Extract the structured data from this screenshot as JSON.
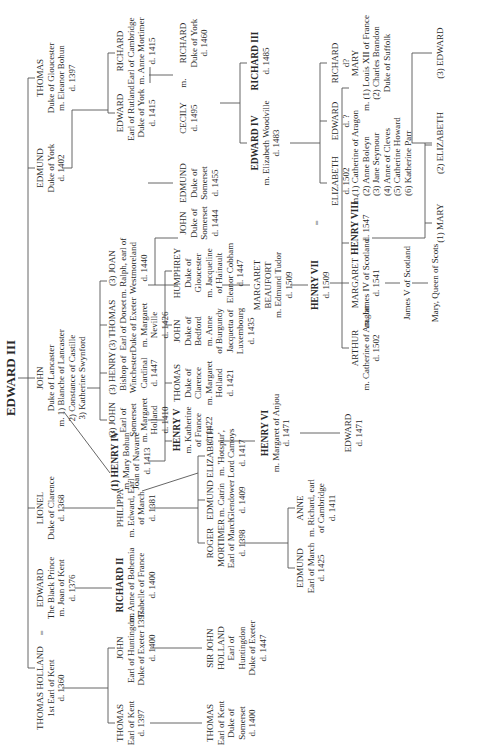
{
  "title": "EDWARD III",
  "nodes": {
    "thomas_holland": {
      "name": "THOMAS HOLLAND",
      "lines": [
        "1st Earl of Kent",
        "d. 1360"
      ]
    },
    "edward_bp": {
      "name": "EDWARD",
      "lines": [
        "The Black Prince",
        "m. Joan of Kent",
        "d. 1376"
      ]
    },
    "lionel": {
      "name": "LIONEL",
      "lines": [
        "Duke of Clarence",
        "d. 1368"
      ]
    },
    "john_gaunt": {
      "name": "JOHN",
      "lines": [
        "Duke of Lancaster",
        "m. 1) Blanche of Lancaster",
        "2) Constance of Castille",
        "3) Katherine Swynford"
      ]
    },
    "edmund_york": {
      "name": "EDMUND",
      "lines": [
        "Duke of York",
        "d. 1402"
      ]
    },
    "thomas_glouc": {
      "name": "THOMAS",
      "lines": [
        "Duke of Gloucester",
        "m. Eleanor Bohun",
        "d. 1397"
      ]
    },
    "thomas_kent": {
      "name": "THOMAS",
      "lines": [
        "Earl of Kent",
        "d. 1397"
      ]
    },
    "john_hunt": {
      "name": "JOHN",
      "lines": [
        "Earl of Huntingdon",
        "Duke of Exeter 1397",
        "d. 1400"
      ]
    },
    "richard2": {
      "name": "RICHARD II",
      "king": true,
      "lines": [
        "m. Anne of Bohemia",
        "Isabelle of France",
        "d. 1400"
      ]
    },
    "philippa": {
      "name": "PHILIPPA",
      "lines": [
        "m. Edward, Earl",
        "of March",
        "d. 1381"
      ]
    },
    "henry4": {
      "name": "(1) HENRY IV",
      "king": true,
      "lines": [
        "m. Mary Bohun",
        "Joan of Navarre",
        "d. 1413"
      ]
    },
    "john_som": {
      "name": "(3) JOHN",
      "lines": [
        "Earl of",
        "Somerset",
        "m. Margaret",
        "Holland",
        "d. 1410"
      ]
    },
    "henry_card": {
      "name": "(3) HENRY",
      "lines": [
        "Bishop of",
        "Winchester",
        "Cardinal",
        "d. 1447"
      ]
    },
    "thomas_dorset": {
      "name": "(3) THOMAS",
      "lines": [
        "Earl of Dorset",
        "Duke of Exeter",
        "m. Margaret",
        "Neville",
        "d. 1426"
      ]
    },
    "joan": {
      "name": "(3) JOAN",
      "lines": [
        "m. Ralph, earl of",
        "Westmoreland",
        "d. 1440"
      ]
    },
    "edward_rutland": {
      "name": "EDWARD",
      "lines": [
        "Earl of Rutland",
        "Duke of York",
        "d. 1415"
      ]
    },
    "richard_camb": {
      "name": "RICHARD",
      "lines": [
        "Earl of Cambridge",
        "m. Anne Mortimer",
        "d. 1415"
      ]
    },
    "thomas_kent2": {
      "name": "THOMAS",
      "lines": [
        "Earl of Kent",
        "Duke of",
        "Somerset",
        "d. 1400"
      ]
    },
    "sir_john": {
      "name": "SIR JOHN",
      "lines": [
        "HOLLAND",
        "Earl of",
        "Huntingdon",
        "Duke of Exeter",
        "d. 1447"
      ]
    },
    "roger": {
      "name": "ROGER",
      "lines": [
        "MORTIMER",
        "Earl of March",
        "d. 1398"
      ]
    },
    "edmund_m": {
      "name": "EDMUND",
      "lines": [
        "m. Catrin",
        "Glendower",
        "d. 1409"
      ]
    },
    "elizabeth_m": {
      "name": "ELIZABETH",
      "lines": [
        "m. 'Hotspur',",
        "Lord Camoys",
        "d. 1417"
      ]
    },
    "henry5": {
      "name": "HENRY V",
      "king": true,
      "lines": [
        "m. Katherine",
        "of France",
        "d. 1422"
      ]
    },
    "thomas_clar": {
      "name": "THOMAS",
      "lines": [
        "Duke of",
        "Clarence",
        "m. Margaret",
        "Holland",
        "d. 1421"
      ]
    },
    "john_bed": {
      "name": "JOHN",
      "lines": [
        "Duke of",
        "Bedford",
        "m. Anne",
        "of Burgundy",
        "Jacquetta of",
        "Luxembourg",
        "d. 1435"
      ]
    },
    "humphrey": {
      "name": "HUMPHREY",
      "lines": [
        "Duke of",
        "Gloucester",
        "m. Jacqueline",
        "of Hainault",
        "Eleanor Cobham",
        "d. 1447"
      ]
    },
    "john_som2": {
      "name": "JOHN",
      "lines": [
        "Duke of",
        "Somerset",
        "d. 1444"
      ]
    },
    "edmund_som": {
      "name": "EDMUND",
      "lines": [
        "Duke of",
        "Somerset",
        "d. 1455"
      ]
    },
    "cecily": {
      "name": "CECILY",
      "lines": [
        "d. 1495"
      ]
    },
    "richard_york": {
      "name": "RICHARD",
      "lines": [
        "Duke of York",
        "d. 1460"
      ]
    },
    "edmund_march": {
      "name": "EDMUND",
      "lines": [
        "Earl of March",
        "d. 1425"
      ]
    },
    "anne": {
      "name": "ANNE",
      "lines": [
        "m. Richard, earl",
        "of Cambridge",
        "d. 1411"
      ]
    },
    "henry6": {
      "name": "HENRY VI",
      "king": true,
      "lines": [
        "m. Margaret of Anjou",
        "d. 1471"
      ]
    },
    "margaret_b": {
      "name": "MARGARET",
      "lines": [
        "BEAUFORT",
        "m. Edmund Tudor",
        "d. 1509"
      ]
    },
    "edward4": {
      "name": "EDWARD IV",
      "king": true,
      "lines": [
        "m. Elizabeth Woodville",
        "d. 1483"
      ]
    },
    "richard3": {
      "name": "RICHARD III",
      "king": true,
      "lines": [
        "d. 1485"
      ]
    },
    "edward_1471": {
      "name": "EDWARD",
      "lines": [
        "d. 1471"
      ]
    },
    "henry7": {
      "name": "HENRY VII",
      "king": true,
      "lines": [
        "d. 1509"
      ]
    },
    "elizabeth_y": {
      "name": "ELIZABETH",
      "lines": [
        "d. 1502"
      ]
    },
    "edward_q": {
      "name": "EDWARD",
      "lines": [
        "d. ?"
      ]
    },
    "richard_q": {
      "name": "RICHARD",
      "lines": [
        "d?"
      ]
    },
    "arthur": {
      "name": "ARTHUR",
      "lines": [
        "m. Catherine of Aragon",
        "d. 1502"
      ]
    },
    "margaret_t": {
      "name": "MARGARET",
      "lines": [
        "m. James IV of Scotland",
        "d. 1541"
      ]
    },
    "james5": {
      "name": "James V of Scotland",
      "lines": []
    },
    "mary_qs": {
      "name": "Mary, Queen of Scots",
      "lines": []
    },
    "henry8": {
      "name": "HENRY VIII",
      "king": true,
      "lines": [
        "d. 1547"
      ]
    },
    "henry8_wives": {
      "name": "(1) Catherine of Aragon",
      "lines": [
        "(2) Anne Boleyn",
        "(3) Jane Seymour",
        "(4) Anne of Cleves",
        "(5) Catherine Howard",
        "(6) Katherine Parr"
      ]
    },
    "mary_t": {
      "name": "MARY",
      "lines": [
        "m. (1) Louis XII of France",
        "(2) Charles Brandon",
        "Duke of Suffolk"
      ]
    },
    "mary1": {
      "name": "(1)  MARY",
      "lines": []
    },
    "elizabeth1": {
      "name": "(2) ELIZABETH",
      "lines": []
    },
    "edward6": {
      "name": "(3) EDWARD",
      "lines": []
    }
  },
  "marks": {
    "eq1": "=",
    "m1": "m.",
    "eq2": "=",
    "m2": "m.",
    "m3": "m."
  }
}
